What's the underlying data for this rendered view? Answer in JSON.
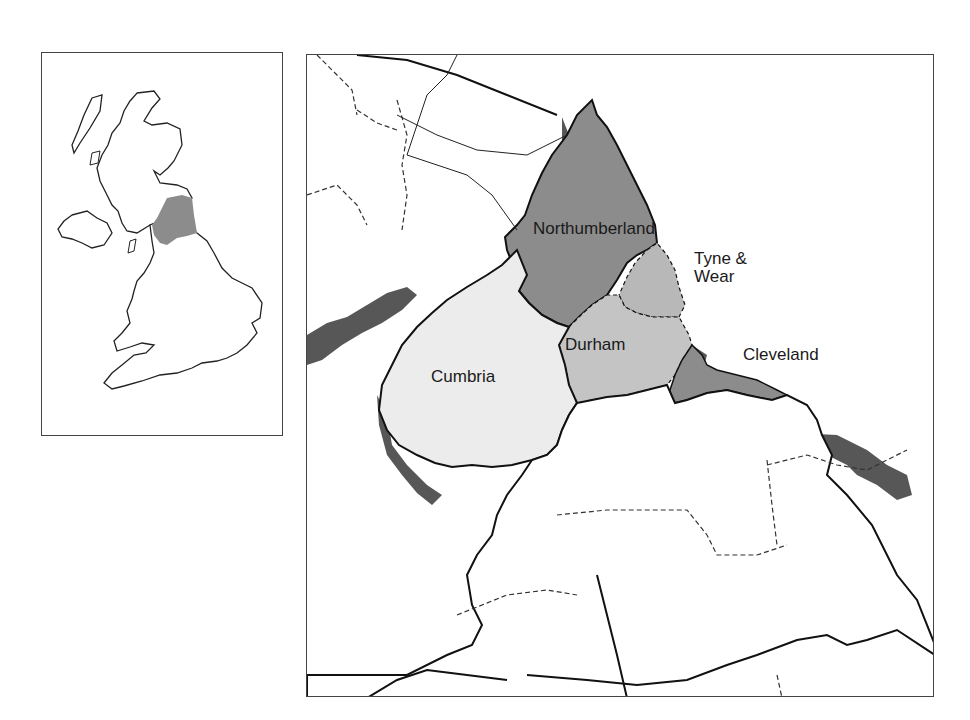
{
  "inset_map": {
    "title": "Great Britain locator",
    "highlight_region": "North East England"
  },
  "main_map": {
    "labels": {
      "northumberland": "Northumberland",
      "tyne_wear_line1": "Tyne &",
      "tyne_wear_line2": "Wear",
      "cleveland": "Cleveland",
      "durham": "Durham",
      "cumbria": "Cumbria"
    },
    "regions": [
      {
        "name": "Northumberland",
        "fill": "#8c8c8c"
      },
      {
        "name": "Tyne & Wear",
        "fill": "#b8b8b8"
      },
      {
        "name": "Durham",
        "fill": "#c4c4c4"
      },
      {
        "name": "Cleveland",
        "fill": "#8c8c8c"
      },
      {
        "name": "Cumbria",
        "fill": "#ececec"
      }
    ]
  },
  "colors": {
    "dark_fill": "#8c8c8c",
    "mid_fill": "#b8b8b8",
    "light_fill": "#c4c4c4",
    "pale_fill": "#ececec",
    "border": "#111111",
    "sea_shadow": "#333333"
  }
}
